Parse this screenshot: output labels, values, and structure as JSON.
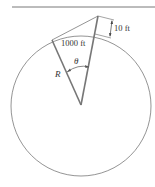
{
  "diagram": {
    "labels": {
      "distance": "1000 ft",
      "height": "10 ft",
      "angle": "θ",
      "radius": "R"
    },
    "colors": {
      "stroke": "#666666",
      "text": "#333333",
      "background": "#ffffff"
    }
  }
}
